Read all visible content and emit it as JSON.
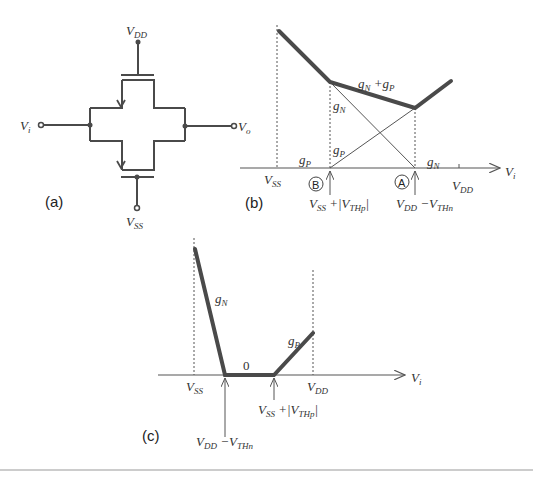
{
  "panel_a": {
    "caption": "(a)",
    "labels": {
      "vdd": "V",
      "vdd_sub": "DD",
      "vss": "V",
      "vss_sub": "SS",
      "vi": "V",
      "vi_sub": "i",
      "vo": "V",
      "vo_sub": "o"
    }
  },
  "panel_b": {
    "caption": "(b)",
    "axis_label": "V",
    "axis_label_sub": "i",
    "tick_vss": "V",
    "tick_vss_sub": "SS",
    "tick_vdd": "V",
    "tick_vdd_sub": "DD",
    "curve_labels": {
      "sum": "g",
      "sum_sub1": "N",
      "sum_plus": " +g",
      "sum_sub2": "P",
      "gn_upper": "g",
      "gn_upper_sub": "N",
      "gp_upper": "g",
      "gp_upper_sub": "P",
      "gp_lower": "g",
      "gp_lower_sub": "P",
      "gn_lower": "g",
      "gn_lower_sub": "N"
    },
    "markers": {
      "b_letter": "B",
      "a_letter": "A",
      "b_expr_v": "V",
      "b_expr_sub": "SS",
      "b_expr_rest": " +|V",
      "b_expr_sub2": "THp",
      "b_expr_end": "|",
      "a_expr_v": "V",
      "a_expr_sub": "DD",
      "a_expr_rest": " −V",
      "a_expr_sub2": "THn"
    }
  },
  "panel_c": {
    "caption": "(c)",
    "axis_label": "V",
    "axis_label_sub": "i",
    "tick_vss": "V",
    "tick_vss_sub": "SS",
    "tick_vdd": "V",
    "tick_vdd_sub": "DD",
    "gn": "g",
    "gn_sub": "N",
    "gp": "g",
    "gp_sub": "P",
    "zero": "0",
    "marker_left_v": "V",
    "marker_left_sub": "DD",
    "marker_left_rest": " −V",
    "marker_left_sub2": "THn",
    "marker_right_v": "V",
    "marker_right_sub": "SS",
    "marker_right_rest": " +|V",
    "marker_right_sub2": "THp",
    "marker_right_end": "|"
  },
  "colors": {
    "line": "#4a4a4a",
    "text": "#333333",
    "background": "#ffffff"
  }
}
